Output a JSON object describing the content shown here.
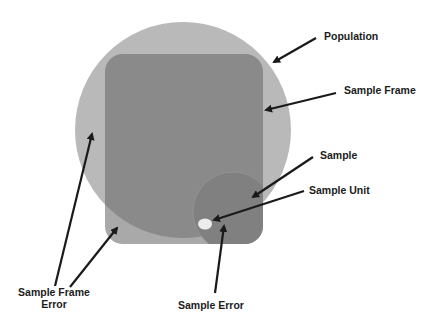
{
  "diagram": {
    "type": "concept-diagram",
    "title": "",
    "colors": {
      "background": "#ffffff",
      "population": "#b9b9b9",
      "sample_frame": "#8a8a8a",
      "frame_outside_population": "#a9a9a9",
      "sample": "#7f7f7f",
      "sample_unit": "#ececec",
      "arrow": "#1a1a1a",
      "text": "#1c1c1c"
    },
    "labels": {
      "population": "Population",
      "sample_frame": "Sample Frame",
      "sample": "Sample",
      "sample_unit": "Sample Unit",
      "sample_frame_error_line1": "Sample Frame",
      "sample_frame_error_line2": "Error",
      "sample_error": "Sample Error"
    }
  }
}
